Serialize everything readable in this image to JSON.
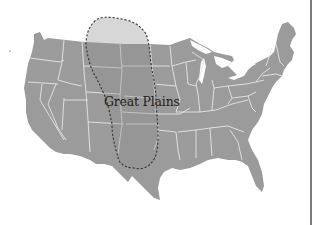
{
  "map": {
    "title": "Great Plains",
    "region_label": "Great Plains",
    "region_style": "dashed-outline",
    "land_color": "#9b9b9b",
    "border_color": "#e6e6e6",
    "outline_color": "#333333"
  }
}
